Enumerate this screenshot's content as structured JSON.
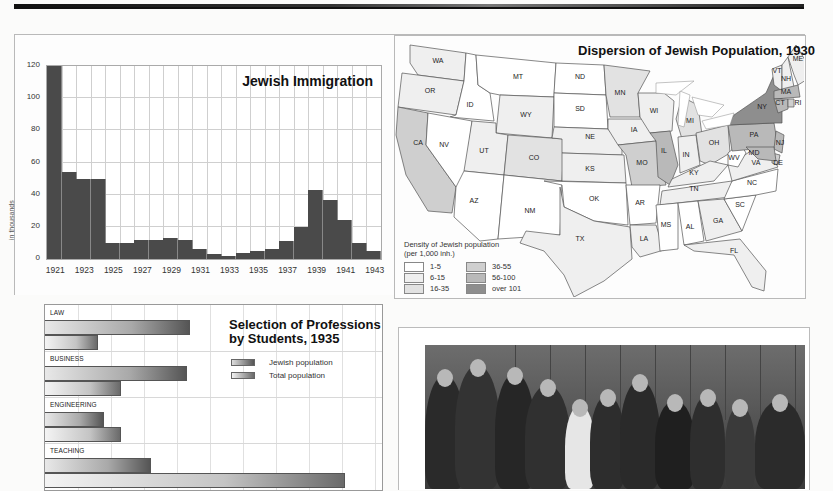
{
  "page": {
    "rule_colors": [
      "#111111",
      "#777777"
    ]
  },
  "chart_data": [
    {
      "type": "bar",
      "title": "Jewish Immigration",
      "xlabel": "",
      "ylabel": "in thousands",
      "ylim": [
        0,
        120
      ],
      "yticks": [
        "0",
        "20",
        "40",
        "60",
        "80",
        "100",
        "120"
      ],
      "x_tick_labels": [
        "1921",
        "1923",
        "1925",
        "1927",
        "1929",
        "1931",
        "1933",
        "1935",
        "1937",
        "1939",
        "1941",
        "1943"
      ],
      "categories": [
        "1921",
        "1922",
        "1923",
        "1924",
        "1925",
        "1926",
        "1927",
        "1928",
        "1929",
        "1930",
        "1931",
        "1932",
        "1933",
        "1934",
        "1935",
        "1936",
        "1937",
        "1938",
        "1939",
        "1940",
        "1941",
        "1942",
        "1943"
      ],
      "values": [
        120,
        54,
        50,
        50,
        10,
        10,
        12,
        12,
        13,
        12,
        6,
        3,
        2,
        4,
        5,
        6,
        11,
        20,
        43,
        37,
        24,
        10,
        5
      ],
      "grid": true,
      "bar_color": "#4a4a4a"
    },
    {
      "type": "bar",
      "orientation": "horizontal",
      "title": "Selection of Professions by Students, 1935",
      "title_lines": [
        "Selection of Professions",
        "by Students, 1935"
      ],
      "categories": [
        "LAW",
        "BUSINESS",
        "ENGINEERING",
        "TEACHING"
      ],
      "series": [
        {
          "name": "Jewish population",
          "values": [
            4.4,
            4.3,
            1.8,
            3.2
          ]
        },
        {
          "name": "Total population",
          "values": [
            1.6,
            2.3,
            2.3,
            9.1
          ]
        }
      ],
      "units": "relative (grid cells)",
      "grid": true,
      "legend_position": "upper right"
    },
    {
      "type": "choropleth",
      "title": "Dispersion of Jewish Population, 1930",
      "legend_title": [
        "Density of Jewish population",
        "(per 1,000 inh.)"
      ],
      "legend": [
        {
          "label": "1-5",
          "color": "#ffffff"
        },
        {
          "label": "6-15",
          "color": "#efefef"
        },
        {
          "label": "16-35",
          "color": "#e2e2e2"
        },
        {
          "label": "36-55",
          "color": "#cfcfcf"
        },
        {
          "label": "56-100",
          "color": "#b9b9b9"
        },
        {
          "label": "over 101",
          "color": "#8e8e8e"
        }
      ],
      "states": {
        "WA": "6-15",
        "OR": "6-15",
        "CA": "36-55",
        "ID": "1-5",
        "NV": "1-5",
        "MT": "1-5",
        "WY": "6-15",
        "UT": "6-15",
        "AZ": "1-5",
        "CO": "16-35",
        "NM": "1-5",
        "ND": "1-5",
        "SD": "1-5",
        "NE": "6-15",
        "KS": "6-15",
        "OK": "1-5",
        "TX": "6-15",
        "MN": "16-35",
        "IA": "6-15",
        "MO": "36-55",
        "AR": "1-5",
        "LA": "6-15",
        "WI": "6-15",
        "IL": "56-100",
        "MI": "16-35",
        "IN": "6-15",
        "OH": "16-35",
        "KY": "6-15",
        "TN": "6-15",
        "MS": "1-5",
        "AL": "1-5",
        "GA": "6-15",
        "FL": "6-15",
        "SC": "1-5",
        "NC": "1-5",
        "VA": "6-15",
        "WV": "1-5",
        "PA": "56-100",
        "NY": "over 101",
        "NJ": "56-100",
        "DE": "36-55",
        "MD": "56-100",
        "CT": "56-100",
        "RI": "36-55",
        "MA": "56-100",
        "VT": "6-15",
        "NH": "6-15",
        "ME": "6-15"
      }
    }
  ],
  "map": {
    "title": "Dispersion of Jewish Population, 1930",
    "legend_title_1": "Density of Jewish population",
    "legend_title_2": "(per 1,000 inh.)",
    "legend": [
      "1-5",
      "6-15",
      "16-35",
      "36-55",
      "56-100",
      "over 101"
    ]
  },
  "immigration": {
    "title": "Jewish Immigration",
    "ylabel": "in thousands"
  },
  "professions": {
    "title_1": "Selection of Professions",
    "title_2": "by Students, 1935",
    "legend_jewish": "Jewish population",
    "legend_total": "Total population",
    "categories": [
      "LAW",
      "BUSINESS",
      "ENGINEERING",
      "TEACHING"
    ]
  },
  "photo": {
    "description": "Black-and-white group photograph of costumed actors with Albert Einstein"
  }
}
